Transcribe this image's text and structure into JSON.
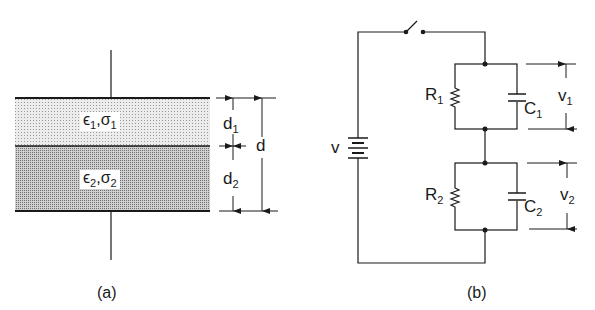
{
  "figure_a": {
    "caption": "(a)",
    "layer1": {
      "eps": "ϵ",
      "eps_sub": "1",
      "sep": ",",
      "sigma": "σ",
      "sigma_sub": "1",
      "fill": "#e4e4e4"
    },
    "layer2": {
      "eps": "ϵ",
      "eps_sub": "2",
      "sep": ",",
      "sigma": "σ",
      "sigma_sub": "2",
      "fill": "#bdbdbd"
    },
    "dim_d1": {
      "base": "d",
      "sub": "1"
    },
    "dim_d2": {
      "base": "d",
      "sub": "2"
    },
    "dim_d": {
      "base": "d"
    }
  },
  "figure_b": {
    "caption": "(b)",
    "source": {
      "label": "v"
    },
    "R1": {
      "base": "R",
      "sub": "1"
    },
    "C1": {
      "base": "C",
      "sub": "1"
    },
    "v1": {
      "base": "v",
      "sub": "1"
    },
    "R2": {
      "base": "R",
      "sub": "2"
    },
    "C2": {
      "base": "C",
      "sub": "2"
    },
    "v2": {
      "base": "v",
      "sub": "2"
    }
  }
}
